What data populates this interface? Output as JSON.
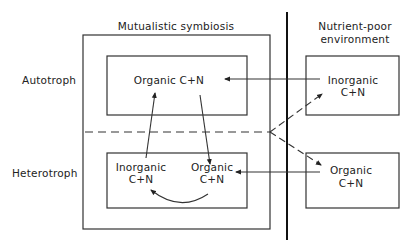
{
  "headers": {
    "symbiosis": "Mutualistic symbiosis",
    "environment_line1": "Nutrient-poor",
    "environment_line2": "environment"
  },
  "row_labels": {
    "autotroph": "Autotroph",
    "heterotroph": "Heterotroph"
  },
  "nodes": {
    "autotroph_organic": "Organic C+N",
    "heterotroph_inorganic_line1": "Inorganic",
    "heterotroph_inorganic_line2": "C+N",
    "heterotroph_organic_line1": "Organic",
    "heterotroph_organic_line2": "C+N",
    "env_inorganic_line1": "Inorganic",
    "env_inorganic_line2": "C+N",
    "env_organic_line1": "Organic",
    "env_organic_line2": "C+N"
  },
  "colors": {
    "line": "#333333",
    "background": "#ffffff"
  }
}
